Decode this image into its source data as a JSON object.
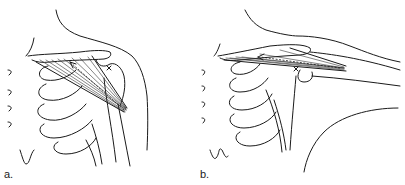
{
  "figure": {
    "panels": [
      {
        "id": "a",
        "label": "a.",
        "description": "Shoulder with arm at side; muscle fibers run from clavicle to humerus, dashed line of action with arrow"
      },
      {
        "id": "b",
        "label": "b.",
        "description": "Shoulder with arm abducted; muscle fibers run horizontally from clavicle to humerus, dashed line of action with arrow pointing medially"
      }
    ]
  }
}
